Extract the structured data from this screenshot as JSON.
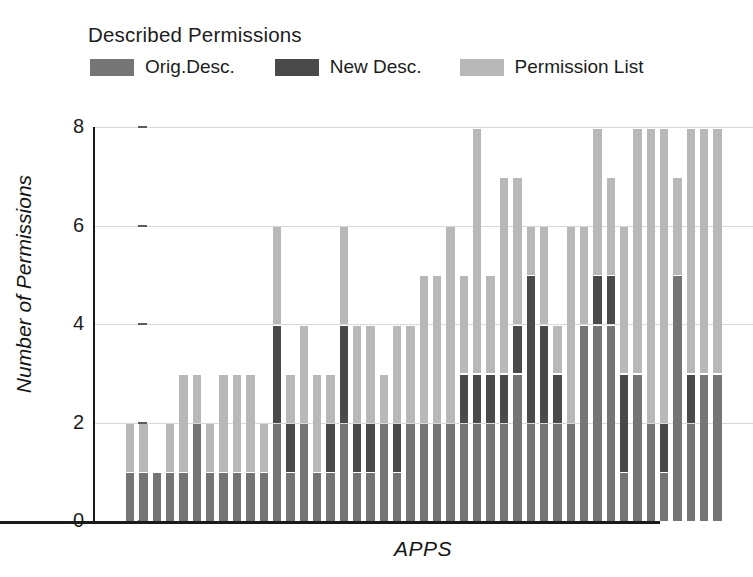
{
  "chart_data": {
    "type": "bar",
    "subtype": "stacked-bar",
    "title": "Described Permissions",
    "xlabel": "APPS",
    "ylabel": "Number of Permissions",
    "ylim": [
      0,
      8
    ],
    "yticks": [
      0,
      2,
      4,
      6,
      8
    ],
    "ytick_labels": [
      "0",
      "2",
      "4",
      "6",
      "8"
    ],
    "grid": true,
    "grid_axis": "y",
    "legend_position": "top",
    "xtick_labels": [],
    "categories": [
      "1",
      "2",
      "3",
      "4",
      "5",
      "6",
      "7",
      "8",
      "9",
      "10",
      "11",
      "12",
      "13",
      "14",
      "15",
      "16",
      "17",
      "18",
      "19",
      "20",
      "21",
      "22",
      "23",
      "24",
      "25",
      "26",
      "27",
      "28",
      "29",
      "30",
      "31",
      "32",
      "33",
      "34",
      "35",
      "36",
      "37",
      "38",
      "39",
      "40",
      "41",
      "42",
      "43",
      "44",
      "45"
    ],
    "series": [
      {
        "name": "Orig.Desc.",
        "color": "#757575",
        "values": [
          1,
          1,
          1,
          1,
          1,
          2,
          1,
          1,
          1,
          1,
          1,
          2,
          1,
          2,
          1,
          1,
          2,
          1,
          1,
          2,
          1,
          2,
          2,
          2,
          2,
          2,
          2,
          2,
          2,
          3,
          2,
          2,
          2,
          2,
          4,
          4,
          4,
          1,
          3,
          2,
          1,
          5,
          2,
          3,
          3
        ]
      },
      {
        "name": "New Desc.",
        "color": "#4a4a4a",
        "values": [
          1,
          1,
          1,
          1,
          1,
          2,
          1,
          1,
          1,
          1,
          1,
          4,
          2,
          2,
          1,
          2,
          4,
          2,
          2,
          2,
          2,
          2,
          2,
          2,
          2,
          3,
          3,
          3,
          3,
          4,
          5,
          4,
          3,
          2,
          4,
          5,
          5,
          3,
          3,
          2,
          2,
          5,
          3,
          3,
          3
        ]
      },
      {
        "name": "Permission List",
        "color": "#b8b8b8",
        "values": [
          2,
          2,
          1,
          2,
          3,
          3,
          2,
          3,
          3,
          3,
          2,
          6,
          3,
          4,
          3,
          3,
          6,
          4,
          4,
          3,
          4,
          4,
          5,
          5,
          6,
          5,
          8,
          5,
          7,
          7,
          6,
          6,
          4,
          6,
          6,
          8,
          7,
          6,
          8,
          8,
          8,
          7,
          8,
          8,
          8
        ]
      }
    ]
  },
  "legend": {
    "title": "Described Permissions",
    "items": [
      {
        "label": "Orig.Desc.",
        "color": "#757575"
      },
      {
        "label": "New Desc.",
        "color": "#4a4a4a"
      },
      {
        "label": "Permission List",
        "color": "#b8b8b8"
      }
    ]
  },
  "axes": {
    "y_title": "Number of Permissions",
    "x_title": "APPS",
    "y_ticks": [
      "0",
      "2",
      "4",
      "6",
      "8"
    ]
  }
}
